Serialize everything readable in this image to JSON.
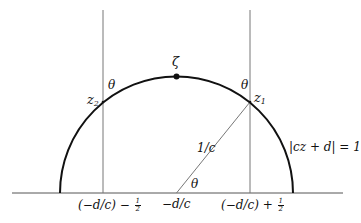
{
  "figure": {
    "type": "geometric-diagram",
    "colors": {
      "background": "#ffffff",
      "ink": "#111111",
      "thin_line": "#555555"
    },
    "geometry": {
      "baseline": {
        "x1": 12,
        "x2": 343,
        "y": 193
      },
      "circle": {
        "cx": 176.5,
        "cy": 193,
        "r": 116.5
      },
      "vertical_left": {
        "x": 103,
        "y_top": 10,
        "y_bottom": 193
      },
      "vertical_right": {
        "x": 250,
        "y_top": 10,
        "y_bottom": 193
      },
      "radius_segment": {
        "x1": 176.5,
        "y1": 193,
        "x2": 250,
        "y2": 102
      },
      "top_point": {
        "x": 176.5,
        "y": 76.5
      }
    },
    "labels": {
      "zeta": "ζ",
      "theta": "θ",
      "z": "z",
      "z1_sub": "1",
      "z2_sub": "2",
      "radius": "1/c",
      "circle_eq": "|cz + d| = 1",
      "center": "−d/c",
      "left_tick_main": "(−d/c) − ",
      "right_tick_main": "(−d/c) + ",
      "half_num": "1",
      "half_den": "2"
    }
  }
}
